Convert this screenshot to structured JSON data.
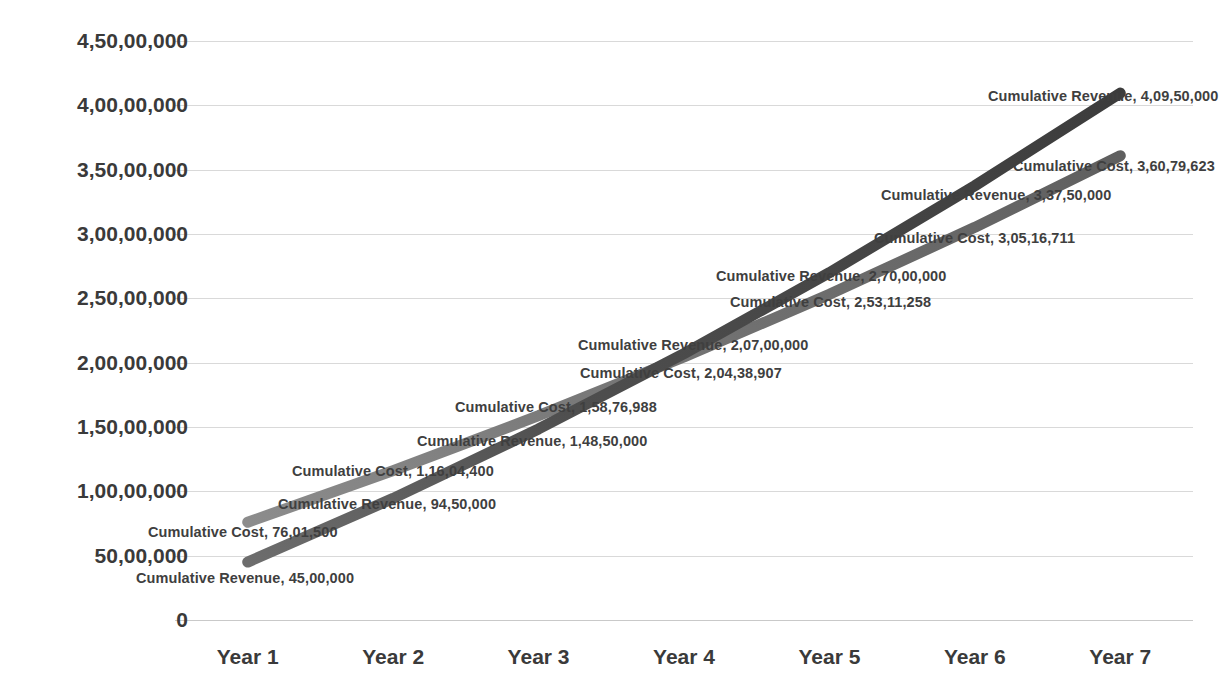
{
  "chart_data": {
    "type": "line",
    "title": "Cumulative Revenue vs Cumulative Cost",
    "xlabel": "",
    "ylabel": "",
    "categories": [
      "Year 1",
      "Year 2",
      "Year 3",
      "Year 4",
      "Year 5",
      "Year 6",
      "Year 7"
    ],
    "ylim": [
      0,
      45000000
    ],
    "ytick_values": [
      0,
      5000000,
      10000000,
      15000000,
      20000000,
      25000000,
      30000000,
      35000000,
      40000000,
      45000000
    ],
    "ytick_labels": [
      "0",
      "50,00,000",
      "1,00,00,000",
      "1,50,00,000",
      "2,00,00,000",
      "2,50,00,000",
      "3,00,00,000",
      "3,50,00,000",
      "4,00,00,000",
      "4,50,00,000"
    ],
    "grid": true,
    "legend": "none",
    "series": [
      {
        "name": "Cumulative Revenue",
        "color": "#4a4a4a",
        "values": [
          4500000,
          9450000,
          14850000,
          20700000,
          27000000,
          33750000,
          40950000
        ],
        "value_labels": [
          "45,00,000",
          "94,50,000",
          "1,48,50,000",
          "2,07,00,000",
          "2,70,00,000",
          "3,37,50,000",
          "4,09,50,000"
        ]
      },
      {
        "name": "Cumulative Cost",
        "color": "#7a7a7a",
        "values": [
          7601500,
          11604400,
          15876988,
          20438907,
          25311258,
          30516711,
          36079623
        ],
        "value_labels": [
          "76,01,500",
          "1,16,04,400",
          "1,58,76,988",
          "2,04,38,907",
          "2,53,11,258",
          "3,05,16,711",
          "3,60,79,623"
        ]
      }
    ],
    "data_labels": [
      {
        "text": "Cumulative Cost, 76,01,500",
        "x": 148,
        "y": 524,
        "anchor": "start"
      },
      {
        "text": "Cumulative Revenue, 45,00,000",
        "x": 136,
        "y": 570,
        "anchor": "start"
      },
      {
        "text": "Cumulative Cost, 1,16,04,400",
        "x": 292,
        "y": 463,
        "anchor": "start"
      },
      {
        "text": "Cumulative Revenue, 94,50,000",
        "x": 278,
        "y": 496,
        "anchor": "start"
      },
      {
        "text": "Cumulative Cost, 1,58,76,988",
        "x": 455,
        "y": 399,
        "anchor": "start"
      },
      {
        "text": "Cumulative Revenue, 1,48,50,000",
        "x": 417,
        "y": 433,
        "anchor": "start"
      },
      {
        "text": "Cumulative Revenue, 2,07,00,000",
        "x": 578,
        "y": 337,
        "anchor": "start"
      },
      {
        "text": "Cumulative Cost, 2,04,38,907",
        "x": 580,
        "y": 365,
        "anchor": "start"
      },
      {
        "text": "Cumulative Revenue, 2,70,00,000",
        "x": 716,
        "y": 268,
        "anchor": "start"
      },
      {
        "text": "Cumulative Cost, 2,53,11,258",
        "x": 730,
        "y": 294,
        "anchor": "start"
      },
      {
        "text": "Cumulative Revenue, 3,37,50,000",
        "x": 881,
        "y": 187,
        "anchor": "start"
      },
      {
        "text": "Cumulative Cost, 3,05,16,711",
        "x": 874,
        "y": 230,
        "anchor": "start"
      },
      {
        "text": "Cumulative Revenue, 4,09,50,000",
        "x": 988,
        "y": 88,
        "anchor": "start"
      },
      {
        "text": "Cumulative Cost, 3,60,79,623",
        "x": 1013,
        "y": 158,
        "anchor": "start"
      }
    ]
  }
}
